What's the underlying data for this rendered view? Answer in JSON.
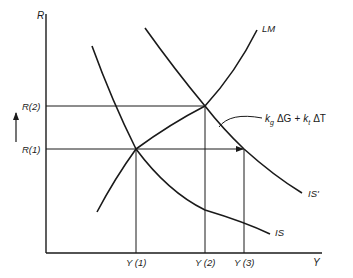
{
  "diagram": {
    "type": "IS-LM",
    "axes": {
      "y_label": "R",
      "x_label": "Y"
    },
    "y_ticks": [
      {
        "label": "R(2)",
        "y": 106
      },
      {
        "label": "R(1)",
        "y": 149
      }
    ],
    "x_ticks": [
      {
        "label": "Y (1)",
        "x": 136
      },
      {
        "label": "Y (2)",
        "x": 205
      },
      {
        "label": "Y (3)",
        "x": 244
      }
    ],
    "curves": {
      "lm": "LM",
      "is": "IS",
      "is_prime": "IS'"
    },
    "shift_annotation": {
      "kg": "k",
      "kg_sub": "g",
      "delta_g": "ΔG",
      "plus": "+",
      "kt": "k",
      "kt_sub": "t",
      "delta_t": "ΔT"
    },
    "colors": {
      "line": "#1a1a1a",
      "background": "#ffffff"
    }
  }
}
